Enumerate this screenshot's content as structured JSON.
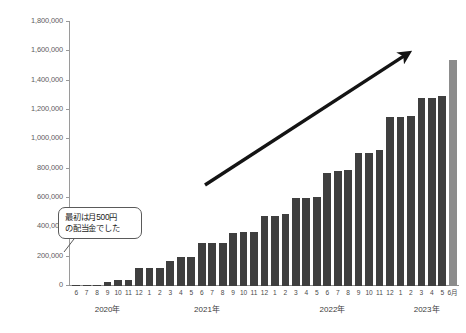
{
  "chart_data": {
    "type": "bar",
    "title": "",
    "xlabel": "",
    "ylabel": "",
    "ylim": [
      0,
      1800000
    ],
    "grid": false,
    "legend": null,
    "ytick_labels": [
      "1,800,000",
      "1,600,000",
      "1,400,000",
      "1,200,000",
      "1,000,000",
      "800,000",
      "600,000",
      "400,000",
      "200,000",
      "0"
    ],
    "ytick_values": [
      1800000,
      1600000,
      1400000,
      1200000,
      1000000,
      800000,
      600000,
      400000,
      200000,
      0
    ],
    "categories": [
      "6",
      "7",
      "8",
      "9",
      "10",
      "11",
      "12",
      "1",
      "2",
      "3",
      "4",
      "5",
      "6",
      "7",
      "8",
      "9",
      "10",
      "11",
      "12",
      "1",
      "2",
      "3",
      "4",
      "5",
      "6",
      "7",
      "8",
      "9",
      "10",
      "11",
      "12",
      "1",
      "2",
      "3",
      "4",
      "5",
      "6月"
    ],
    "values": [
      10000,
      10000,
      10000,
      30000,
      40000,
      40000,
      120000,
      120000,
      125000,
      170000,
      195000,
      195000,
      290000,
      295000,
      295000,
      360000,
      370000,
      365000,
      480000,
      480000,
      490000,
      600000,
      600000,
      610000,
      770000,
      785000,
      790000,
      905000,
      910000,
      925000,
      1150000,
      1155000,
      1160000,
      1280000,
      1285000,
      1295000,
      1540000
    ],
    "highlight_index": 36,
    "bar_color": "#3f3f3f",
    "highlight_color": "#8c8c8c",
    "year_groups": [
      {
        "label": "2020年",
        "start": 0,
        "count": 7
      },
      {
        "label": "2021年",
        "start": 7,
        "count": 12
      },
      {
        "label": "2022年",
        "start": 19,
        "count": 12
      },
      {
        "label": "2023年",
        "start": 31,
        "count": 6
      }
    ],
    "annotations": [
      {
        "name": "callout",
        "line_1": "最初は月500円",
        "line_2": "の配当金でした"
      },
      {
        "name": "trend-arrow",
        "from": [
          205,
          185
        ],
        "to": [
          410,
          52
        ]
      }
    ]
  },
  "title_strip": ""
}
